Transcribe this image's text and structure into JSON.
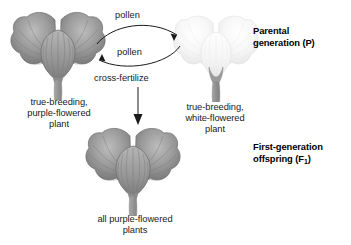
{
  "diagram": {
    "generations": [
      {
        "id": "parental",
        "label": "Parental\ngeneration (P)"
      },
      {
        "id": "f1",
        "label": "First-generation\noffspring (F1)"
      }
    ],
    "plants": [
      {
        "id": "purple-parent",
        "caption": "true-breeding,\npurple-flowered\nplant",
        "flower_color": "#8d8d8d",
        "stem_color": "#9a9a9a"
      },
      {
        "id": "white-parent",
        "caption": "true-breeding,\nwhite-flowered\nplant",
        "flower_color": "#f2f2f2",
        "stem_color": "#9a9a9a"
      },
      {
        "id": "f1-offspring",
        "caption": "all purple-flowered\nplants",
        "flower_color": "#8d8d8d",
        "stem_color": "#9a9a9a"
      }
    ],
    "arrows": [
      {
        "id": "pollen-right",
        "label": "pollen",
        "direction": "left-to-right"
      },
      {
        "id": "pollen-left",
        "label": "pollen",
        "direction": "right-to-left"
      },
      {
        "id": "cross-fertilize",
        "label": "cross-fertilize",
        "direction": "downward"
      }
    ],
    "f1_label_prefix": "First-generation\noffspring (F",
    "f1_label_sub": "1",
    "f1_label_suffix": ")"
  }
}
